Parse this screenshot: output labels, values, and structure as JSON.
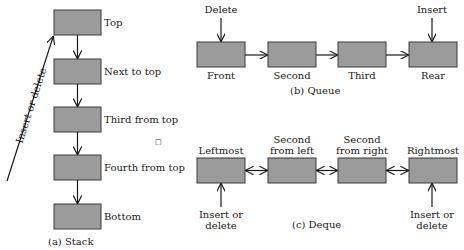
{
  "colors": {
    "box_fill": "#9b9b9b",
    "box_stroke": "#3a3a3a",
    "line": "#1a1a1a"
  },
  "stack": {
    "caption": "(a)  Stack",
    "items": [
      "Top",
      "Next to top",
      "Third from top",
      "Fourth from top",
      "Bottom"
    ],
    "side_arrow_label": "Insert or delete"
  },
  "queue": {
    "caption": "(b)  Queue",
    "items": [
      "Front",
      "Second",
      "Third",
      "Rear"
    ],
    "delete_label": "Delete",
    "insert_label": "Insert"
  },
  "deque": {
    "caption": "(c)  Deque",
    "items": [
      {
        "line1": "",
        "line2": "Leftmost"
      },
      {
        "line1": "Second",
        "line2": "from left"
      },
      {
        "line1": "Second",
        "line2": "from right"
      },
      {
        "line1": "",
        "line2": "Rightmost"
      }
    ],
    "left_op": {
      "line1": "Insert or",
      "line2": "delete"
    },
    "right_op": {
      "line1": "Insert or",
      "line2": "delete"
    }
  },
  "stray_mark": "□"
}
